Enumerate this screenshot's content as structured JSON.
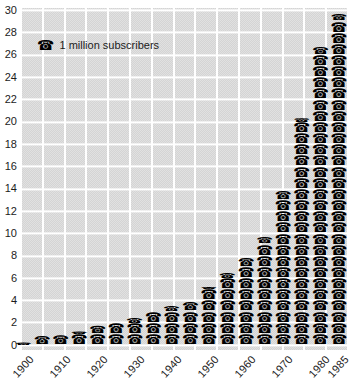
{
  "colors": {
    "page_bg": "#ffffff",
    "plot_bg": "#dadada",
    "grid": "#ffffff",
    "icon": "#000000",
    "text": "#1c1c1c"
  },
  "legend": {
    "icon": "telephone-icon",
    "icon_char": "☎",
    "label": "1 million subscribers"
  },
  "y_axis": {
    "ticks": [
      0,
      2,
      4,
      6,
      8,
      10,
      12,
      14,
      16,
      18,
      20,
      22,
      24,
      26,
      28,
      30
    ]
  },
  "x_axis": {
    "labeled_categories": [
      "1900",
      "1910",
      "1920",
      "1930",
      "1940",
      "1950",
      "1960",
      "1970",
      "1980",
      "1985"
    ]
  },
  "chart_data": {
    "type": "bar",
    "style": "pictogram",
    "icon_unit": "1 telephone icon = 1 million subscribers",
    "title": "",
    "xlabel": "",
    "ylabel": "",
    "ylim": [
      0,
      30
    ],
    "grid": true,
    "legend_position": "top-left",
    "categories": [
      "1900",
      "1905",
      "1910",
      "1915",
      "1920",
      "1925",
      "1930",
      "1935",
      "1940",
      "1945",
      "1950",
      "1955",
      "1960",
      "1965",
      "1970",
      "1975",
      "1980",
      "1985"
    ],
    "values": [
      0.25,
      0.8,
      0.9,
      1.25,
      1.75,
      2.0,
      2.5,
      3.0,
      3.5,
      3.8,
      5.2,
      6.5,
      7.8,
      9.6,
      13.8,
      20.4,
      26.7,
      29.6
    ]
  }
}
